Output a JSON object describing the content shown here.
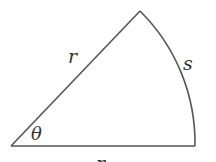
{
  "diagram": {
    "type": "circular-sector",
    "labels": {
      "radius_top": "r",
      "arc": "s",
      "angle": "θ",
      "radius_bottom": "r"
    },
    "colors": {
      "stroke": "#555555",
      "text": "#333333",
      "background": "#ffffff"
    }
  }
}
